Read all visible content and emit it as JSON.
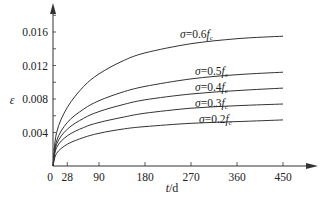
{
  "chart_data": {
    "type": "line",
    "title": "",
    "xlabel": "t/d",
    "ylabel": "ε",
    "xlim": [
      0,
      480
    ],
    "ylim": [
      0,
      0.018
    ],
    "xticks": [
      0,
      28,
      90,
      180,
      270,
      360,
      450
    ],
    "xtick_labels": [
      "0",
      "28",
      "90",
      "180",
      "270",
      "360",
      "450"
    ],
    "yticks": [
      0.004,
      0.008,
      0.012,
      0.016
    ],
    "ytick_labels": [
      "0.004",
      "0.008",
      "0.012",
      "0.016"
    ],
    "grid": false,
    "legend": "inline labels at curve ends",
    "x": [
      0,
      7,
      28,
      60,
      90,
      135,
      180,
      270,
      360,
      450
    ],
    "series": [
      {
        "name": "σ=0.6fc",
        "label_prefix": "σ=0.6",
        "label_f": "f",
        "label_sub": "c",
        "values": [
          0,
          0.004,
          0.007,
          0.0095,
          0.011,
          0.0125,
          0.0135,
          0.0146,
          0.0152,
          0.0155
        ]
      },
      {
        "name": "σ=0.5fc",
        "label_prefix": "σ=0.5",
        "label_f": "f",
        "label_sub": "c",
        "values": [
          0,
          0.003,
          0.0052,
          0.0068,
          0.0078,
          0.0088,
          0.0095,
          0.0104,
          0.0109,
          0.0112
        ]
      },
      {
        "name": "σ=0.4fc",
        "label_prefix": "σ=0.4",
        "label_f": "f",
        "label_sub": "c",
        "values": [
          0,
          0.0026,
          0.0044,
          0.0057,
          0.0065,
          0.0073,
          0.0079,
          0.0086,
          0.009,
          0.0093
        ]
      },
      {
        "name": "σ=0.3fc",
        "label_prefix": "σ=0.3",
        "label_f": "f",
        "label_sub": "c",
        "values": [
          0,
          0.0022,
          0.0036,
          0.0046,
          0.0052,
          0.0058,
          0.0063,
          0.0069,
          0.0072,
          0.0074
        ]
      },
      {
        "name": "σ=0.2fc",
        "label_prefix": "σ=0.2",
        "label_f": "f",
        "label_sub": "c",
        "values": [
          0,
          0.0015,
          0.0026,
          0.0034,
          0.0039,
          0.0044,
          0.0047,
          0.0051,
          0.0053,
          0.0055
        ]
      }
    ]
  },
  "style": {
    "line_color": "#333333",
    "axis_color": "#333333"
  }
}
